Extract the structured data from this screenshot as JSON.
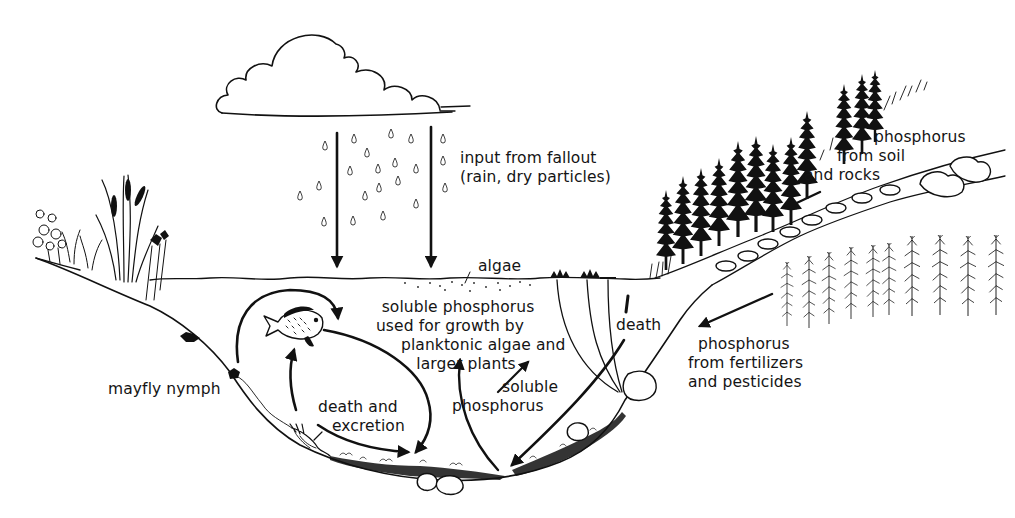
{
  "diagram": {
    "labels": {
      "fallout": {
        "line1": "input from fallout",
        "line2": "(rain, dry particles)"
      },
      "algae": "algae",
      "soil": {
        "line1": "phosphorus",
        "line2": "from  soil",
        "line3": "and rocks"
      },
      "soluble_growth": {
        "line1": "soluble  phosphorus",
        "line2": "used  for growth by",
        "line3": "planktonic  algae and",
        "line4": "larger  plants"
      },
      "death": "death",
      "soluble": {
        "line1": "soluble",
        "line2": "phosphorus"
      },
      "fertilizers": {
        "line1": "phosphorus",
        "line2": "from fertilizers",
        "line3": "and pesticides"
      },
      "mayfly": "mayfly nymph",
      "death_excretion": {
        "line1": "death  and",
        "line2": "excretion"
      }
    },
    "elements": {
      "sources": [
        "cloud with rain",
        "forest soil and rocks",
        "cornfield"
      ],
      "organisms": [
        "sunfish",
        "mayfly nymph",
        "cattails",
        "water lilies",
        "planktonic algae",
        "conifers",
        "corn"
      ],
      "flows": [
        "rainfall arrows into lake",
        "runoff arrow from soil and rocks",
        "runoff arrow from fertilizers",
        "sediment to mayfly nymph to fish cycle",
        "death and excretion to sediment",
        "plant death to sediment",
        "sediment release of soluble phosphorus"
      ]
    },
    "colors": {
      "ink": "#111111",
      "paper": "#ffffff"
    }
  }
}
